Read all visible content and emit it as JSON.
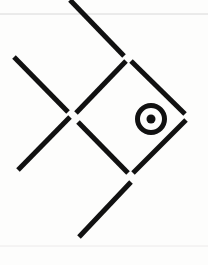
{
  "canvas": {
    "width": 208,
    "height": 265,
    "background_color": "#fdfdfc",
    "title": "Matchstick fish figure"
  },
  "palette": {
    "ink": "#111111",
    "paper": "#fdfdfc",
    "rule_line": "#d8d8d8",
    "faint_rule_line": "#eceaea"
  },
  "figure": {
    "name": "fish",
    "stroke_color": "#111111",
    "stroke_width": 5,
    "segment_count": 8,
    "segments": [
      {
        "name": "tail-upper-stick",
        "label": "tail upper arm",
        "x1": 14,
        "y1": 57,
        "x2": 68,
        "y2": 112
      },
      {
        "name": "tail-lower-stick",
        "label": "tail lower arm",
        "x1": 18,
        "y1": 170,
        "x2": 70,
        "y2": 117
      },
      {
        "name": "dorsal-fin-stick",
        "label": "top fin",
        "x1": 70,
        "y1": 0,
        "x2": 124,
        "y2": 56
      },
      {
        "name": "body-upper-left-stick",
        "label": "body upper left edge",
        "x1": 76,
        "y1": 113,
        "x2": 126,
        "y2": 61
      },
      {
        "name": "body-upper-right-stick",
        "label": "body upper right edge",
        "x1": 131,
        "y1": 61,
        "x2": 185,
        "y2": 114
      },
      {
        "name": "body-lower-left-stick",
        "label": "body lower left edge",
        "x1": 78,
        "y1": 122,
        "x2": 128,
        "y2": 173
      },
      {
        "name": "body-lower-right-stick",
        "label": "body lower right edge",
        "x1": 186,
        "y1": 120,
        "x2": 133,
        "y2": 173
      },
      {
        "name": "ventral-fin-stick",
        "label": "bottom fin",
        "x1": 79,
        "y1": 237,
        "x2": 131,
        "y2": 182
      }
    ],
    "eye": {
      "name": "fish-eye",
      "label": "eye",
      "center_x": 151,
      "center_y": 119,
      "outer_radius": 16,
      "ring_stroke_width": 5,
      "pupil_radius": 4.5,
      "color": "#111111"
    }
  },
  "paper_rules": [
    {
      "name": "top-rule-line",
      "y": 14,
      "x1": 0,
      "x2": 208,
      "color": "#d8d8d8",
      "width": 1
    },
    {
      "name": "bottom-rule-line",
      "y": 246,
      "x1": 0,
      "x2": 208,
      "color": "#eceaea",
      "width": 1
    }
  ]
}
